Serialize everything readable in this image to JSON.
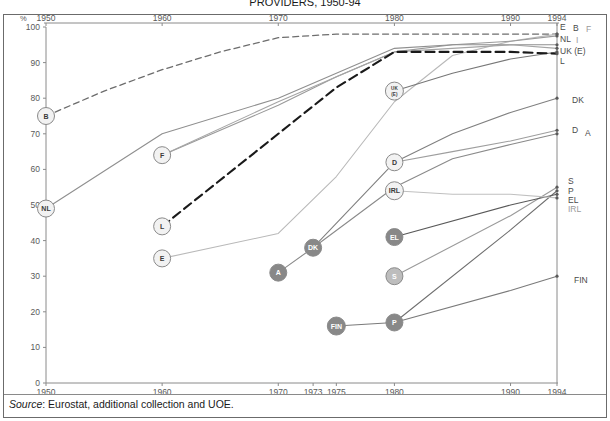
{
  "figure": {
    "title": "PROVIDERS, 1950-94",
    "source_prefix": "Source",
    "source_text": ": Eurostat, additional collection and UOE.",
    "y_unit": "%"
  },
  "chart_data": {
    "type": "line",
    "title": "PROVIDERS, 1950-94",
    "xlabel": "",
    "ylabel": "%",
    "ylim": [
      0,
      100
    ],
    "xlim": [
      1950,
      1994
    ],
    "grid": false,
    "legend": "right-edge-labels",
    "y_ticks": [
      "0",
      "10",
      "20",
      "30",
      "40",
      "50",
      "60",
      "70",
      "80",
      "90",
      "100"
    ],
    "x_ticks_bottom": [
      "1950",
      "1960",
      "1970",
      "1973",
      "1975",
      "1980",
      "1990",
      "1994"
    ],
    "x_ticks_top": [
      "1950",
      "1960",
      "1970",
      "1980",
      "1990",
      "1994"
    ],
    "end_labels_right": [
      "E",
      "B",
      "F",
      "NL",
      "I",
      "UK (E)",
      "L",
      "DK",
      "D",
      "A",
      "S",
      "P",
      "EL",
      "IRL",
      "FIN"
    ],
    "start_markers": [
      {
        "label": "B",
        "year": 1950,
        "value": 75
      },
      {
        "label": "NL",
        "year": 1950,
        "value": 49
      },
      {
        "label": "F",
        "year": 1960,
        "value": 64
      },
      {
        "label": "L",
        "year": 1960,
        "value": 44
      },
      {
        "label": "E",
        "year": 1960,
        "value": 35
      },
      {
        "label": "A",
        "year": 1970,
        "value": 31
      },
      {
        "label": "DK",
        "year": 1973,
        "value": 38
      },
      {
        "label": "FIN",
        "year": 1975,
        "value": 16
      },
      {
        "label": "UK (E)",
        "year": 1980,
        "value": 82
      },
      {
        "label": "D",
        "year": 1980,
        "value": 62
      },
      {
        "label": "IRL",
        "year": 1980,
        "value": 54
      },
      {
        "label": "EL",
        "year": 1980,
        "value": 41
      },
      {
        "label": "S",
        "year": 1980,
        "value": 30
      },
      {
        "label": "P",
        "year": 1980,
        "value": 17
      }
    ],
    "series": [
      {
        "name": "B",
        "style": "dashed",
        "color": "#6d6d6d",
        "width": 1.3,
        "points": [
          [
            1950,
            75
          ],
          [
            1955,
            82
          ],
          [
            1960,
            88
          ],
          [
            1965,
            93
          ],
          [
            1970,
            97
          ],
          [
            1975,
            98
          ],
          [
            1980,
            98
          ],
          [
            1990,
            98
          ],
          [
            1994,
            98
          ]
        ]
      },
      {
        "name": "E",
        "style": "solid",
        "color": "#b9b9b9",
        "width": 1.1,
        "points": [
          [
            1960,
            35
          ],
          [
            1970,
            42
          ],
          [
            1975,
            58
          ],
          [
            1980,
            79
          ],
          [
            1985,
            92
          ],
          [
            1990,
            96
          ],
          [
            1994,
            98
          ]
        ]
      },
      {
        "name": "F",
        "style": "solid",
        "color": "#9a9a9a",
        "width": 1.1,
        "points": [
          [
            1960,
            64
          ],
          [
            1970,
            78
          ],
          [
            1975,
            86
          ],
          [
            1980,
            93
          ],
          [
            1985,
            95
          ],
          [
            1990,
            96
          ],
          [
            1994,
            97.5
          ]
        ]
      },
      {
        "name": "NL",
        "style": "solid",
        "color": "#8f8f8f",
        "width": 1.1,
        "points": [
          [
            1950,
            49
          ],
          [
            1960,
            70
          ],
          [
            1970,
            80
          ],
          [
            1980,
            94
          ],
          [
            1985,
            95
          ],
          [
            1990,
            95
          ],
          [
            1994,
            95
          ]
        ]
      },
      {
        "name": "I",
        "style": "solid",
        "color": "#a5a5a5",
        "width": 1.1,
        "points": [
          [
            1960,
            64
          ],
          [
            1970,
            79
          ],
          [
            1980,
            93
          ],
          [
            1990,
            95
          ],
          [
            1994,
            94
          ]
        ]
      },
      {
        "name": "UK (E)",
        "style": "solid",
        "color": "#777777",
        "width": 1.1,
        "points": [
          [
            1980,
            82
          ],
          [
            1985,
            87
          ],
          [
            1990,
            91
          ],
          [
            1994,
            93
          ]
        ]
      },
      {
        "name": "L",
        "style": "dash-bold",
        "color": "#1a1a1a",
        "width": 2.1,
        "points": [
          [
            1960,
            44
          ],
          [
            1970,
            70
          ],
          [
            1975,
            83
          ],
          [
            1980,
            93
          ],
          [
            1990,
            93
          ],
          [
            1994,
            92.5
          ]
        ]
      },
      {
        "name": "DK",
        "style": "solid",
        "color": "#808080",
        "width": 1.1,
        "points": [
          [
            1973,
            38
          ],
          [
            1980,
            62
          ],
          [
            1985,
            70
          ],
          [
            1990,
            76
          ],
          [
            1994,
            80
          ]
        ]
      },
      {
        "name": "D",
        "style": "solid",
        "color": "#9e9e9e",
        "width": 1.1,
        "points": [
          [
            1980,
            62
          ],
          [
            1985,
            65
          ],
          [
            1990,
            68
          ],
          [
            1994,
            71
          ]
        ]
      },
      {
        "name": "A",
        "style": "solid",
        "color": "#8a8a8a",
        "width": 1.1,
        "points": [
          [
            1970,
            31
          ],
          [
            1973,
            38
          ],
          [
            1980,
            55
          ],
          [
            1985,
            63
          ],
          [
            1990,
            67
          ],
          [
            1994,
            70
          ]
        ]
      },
      {
        "name": "S",
        "style": "solid",
        "color": "#9a9a9a",
        "width": 1.1,
        "points": [
          [
            1980,
            30
          ],
          [
            1990,
            47
          ],
          [
            1994,
            55
          ]
        ]
      },
      {
        "name": "P",
        "style": "solid",
        "color": "#6f6f6f",
        "width": 1.1,
        "points": [
          [
            1980,
            17
          ],
          [
            1990,
            43
          ],
          [
            1994,
            54
          ]
        ]
      },
      {
        "name": "EL",
        "style": "solid",
        "color": "#595959",
        "width": 1.1,
        "points": [
          [
            1980,
            41
          ],
          [
            1990,
            50
          ],
          [
            1994,
            53
          ]
        ]
      },
      {
        "name": "IRL",
        "style": "solid",
        "color": "#c0c0c0",
        "width": 1.1,
        "points": [
          [
            1980,
            54
          ],
          [
            1985,
            53
          ],
          [
            1990,
            53
          ],
          [
            1994,
            52
          ]
        ]
      },
      {
        "name": "FIN",
        "style": "solid",
        "color": "#7a7a7a",
        "width": 1.1,
        "points": [
          [
            1975,
            16
          ],
          [
            1980,
            17
          ],
          [
            1990,
            26
          ],
          [
            1994,
            30
          ]
        ]
      }
    ]
  }
}
